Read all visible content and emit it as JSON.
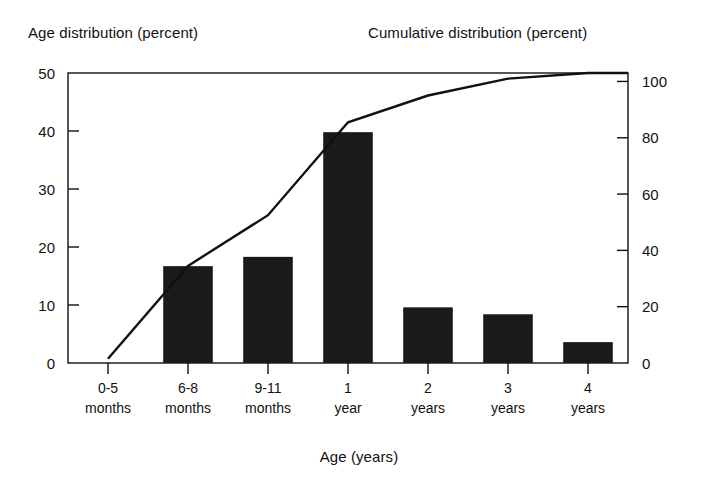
{
  "chart_data": {
    "type": "bar",
    "title": "",
    "subtitle": "",
    "xlabel": "Age (years)",
    "ylabel": "Age distribution (percent)",
    "ylabel_right": "Cumulative distribution (percent)",
    "categories": [
      "0-5 months",
      "6-8 months",
      "9-11 months",
      "1 year",
      "2 years",
      "3 years",
      "4 years"
    ],
    "category_lines": [
      [
        "0-5",
        "months"
      ],
      [
        "6-8",
        "months"
      ],
      [
        "9-11",
        "months"
      ],
      [
        "1",
        "year"
      ],
      [
        "2",
        "years"
      ],
      [
        "3",
        "years"
      ],
      [
        "4",
        "years"
      ]
    ],
    "values": [
      0,
      16.7,
      18.3,
      39.8,
      9.6,
      8.4,
      3.6
    ],
    "ylim": [
      0,
      50
    ],
    "yticks": [
      0,
      10,
      20,
      30,
      40,
      50
    ],
    "ytick_labels": [
      "0",
      "10",
      "20",
      "30",
      "40",
      "50"
    ],
    "ylim_right": [
      0,
      103
    ],
    "yticks_right": [
      0,
      20,
      40,
      60,
      80,
      100
    ],
    "ytick_labels_right": [
      "0",
      "20",
      "40",
      "60",
      "80",
      "100"
    ],
    "grid": false,
    "legend": "none",
    "bar_color": "#1a1a1a",
    "line_color": "#111111",
    "series": [
      {
        "name": "Age distribution (percent)",
        "type": "bar",
        "axis": "left",
        "values": [
          0,
          16.7,
          18.3,
          39.8,
          9.6,
          8.4,
          3.6
        ]
      },
      {
        "name": "Cumulative distribution (percent)",
        "type": "line",
        "axis": "right",
        "values": [
          1.5,
          34.5,
          52.5,
          85.5,
          95.0,
          101.0,
          103.0
        ]
      }
    ]
  },
  "axis_titles": {
    "left": "Age distribution (percent)",
    "right": "Cumulative distribution (percent)",
    "bottom": "Age (years)"
  },
  "colors": {
    "bar": "#1a1a1a",
    "line": "#111111",
    "axis": "#111111",
    "background": "#ffffff"
  }
}
